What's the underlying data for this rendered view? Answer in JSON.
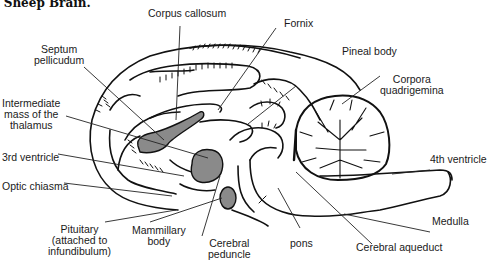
{
  "title": "t Sheep Brain.",
  "labels": {
    "corpus_callosum": "Corpus callosum",
    "fornix": "Fornix",
    "septum_pellucidum_1": "Septum",
    "septum_pellucidum_2": "pellicudum",
    "pineal_body": "Pineal body",
    "corpora_quadrigemina_1": "Corpora",
    "corpora_quadrigemina_2": "quadrigemina",
    "intermediate_mass_1": "Intermediate",
    "intermediate_mass_2": "mass of the",
    "intermediate_mass_3": "thalamus",
    "third_ventricle": "3rd ventricle",
    "fourth_ventricle": "4th ventricle",
    "optic_chiasma": "Optic chiasma",
    "medulla": "Medulla",
    "pituitary_1": "Pituitary",
    "pituitary_2": "(attached to",
    "pituitary_3": "infundibulum)",
    "mammillary_body_1": "Mammillary",
    "mammillary_body_2": "body",
    "cerebral_peduncle_1": "Cerebral",
    "cerebral_peduncle_2": "peduncle",
    "pons": "pons",
    "cerebral_aqueduct": "Cerebral aqueduct"
  },
  "colors": {
    "line": "#111111",
    "fill_gray": "#8a8a8a",
    "background": "#ffffff"
  }
}
